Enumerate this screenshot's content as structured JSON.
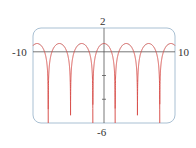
{
  "chart_data": {
    "type": "line",
    "title": "",
    "xlabel": "",
    "ylabel": "",
    "xlim": [
      -10,
      10
    ],
    "ylim": [
      -6,
      2
    ],
    "grid": false,
    "legend": null,
    "tick_labels": {
      "x_min": "-10",
      "x_max": "10",
      "y_max": "2",
      "y_min": "-6"
    },
    "y_ticks": [
      -2,
      -4
    ],
    "series": [
      {
        "name": "curve",
        "color": "#d9534f",
        "description": "periodic arches with vertical asymptotes at odd multiples of pi/2; peaks near y=0.7 at x=0, ±2pi",
        "peaks": [
          [
            -6.28,
            0.69
          ],
          [
            0,
            0.69
          ],
          [
            6.28,
            0.69
          ]
        ],
        "asymptotes_x": [
          -7.85,
          -4.71,
          -1.57,
          1.57,
          4.71,
          7.85
        ]
      }
    ]
  },
  "colors": {
    "frame": "#9fb8cc",
    "axis": "#555555",
    "curve": "#d9534f"
  }
}
